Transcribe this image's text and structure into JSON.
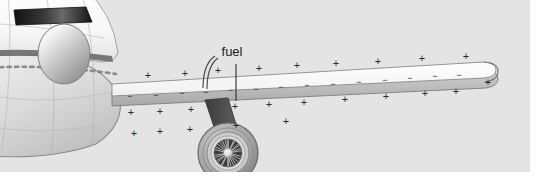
{
  "figure": {
    "name": "aircraft-wing-fuel-diagram",
    "width": 551,
    "height": 189,
    "background_color": "#ffffff",
    "panel_color": "#e4e4e4",
    "panel": {
      "x": 0,
      "y": 0,
      "width": 530,
      "height": 172
    }
  },
  "annotations": {
    "fuel_label": "fuel",
    "fuel_label_x": 232,
    "fuel_label_y": 60,
    "leader_line": {
      "x": 236,
      "y1": 64,
      "y2": 100
    },
    "flow_arrow": {
      "description": "curved-double-line-arrow"
    }
  },
  "colors": {
    "panel": "#e4e4e4",
    "fuselage_light": "#fdfdfd",
    "fuselage_shadow": "#c9c9c9",
    "fuselage_outline": "#8a8a8a",
    "windshield_dark": "#1c1c1c",
    "cheatline": "#6e6e6e",
    "nose_highlight": "#f2f2f2",
    "nose_mid": "#b9b9b9",
    "nose_dark": "#8e8e8e",
    "wing_top": "#fbfbfb",
    "wing_edge": "#b5b5b5",
    "wing_outline": "#7d7d7d",
    "pylon": "#4a4a4a",
    "nacelle_outer": "#9b9b9b",
    "nacelle_mid": "#c4c4c4",
    "fan_dark": "#3a3a3a",
    "spinner": "#e8e8e8",
    "symbol": "#2b2b2b",
    "text": "#1a1a1a"
  },
  "charges": {
    "plus_symbol": "+",
    "minus_symbol": "−",
    "plus_above_wing": [
      {
        "x": 148,
        "y": 76
      },
      {
        "x": 185,
        "y": 74
      },
      {
        "x": 218,
        "y": 71
      },
      {
        "x": 259,
        "y": 69
      },
      {
        "x": 297,
        "y": 66
      },
      {
        "x": 336,
        "y": 64
      },
      {
        "x": 378,
        "y": 62
      },
      {
        "x": 422,
        "y": 59
      },
      {
        "x": 466,
        "y": 57
      }
    ],
    "plus_below_wing": [
      {
        "x": 131,
        "y": 113
      },
      {
        "x": 160,
        "y": 112
      },
      {
        "x": 191,
        "y": 110
      },
      {
        "x": 235,
        "y": 107
      },
      {
        "x": 269,
        "y": 105
      },
      {
        "x": 304,
        "y": 103
      },
      {
        "x": 345,
        "y": 100
      },
      {
        "x": 386,
        "y": 97
      },
      {
        "x": 425,
        "y": 94
      },
      {
        "x": 456,
        "y": 92
      },
      {
        "x": 488,
        "y": 83
      }
    ],
    "plus_lower_row": [
      {
        "x": 134,
        "y": 134
      },
      {
        "x": 160,
        "y": 132
      },
      {
        "x": 190,
        "y": 130
      },
      {
        "x": 236,
        "y": 126
      },
      {
        "x": 286,
        "y": 122
      }
    ],
    "minus_on_wing": [
      {
        "x": 130,
        "y": 97
      },
      {
        "x": 156,
        "y": 96
      },
      {
        "x": 182,
        "y": 94
      },
      {
        "x": 206,
        "y": 93
      },
      {
        "x": 231,
        "y": 91
      },
      {
        "x": 256,
        "y": 90
      },
      {
        "x": 281,
        "y": 88
      },
      {
        "x": 307,
        "y": 86
      },
      {
        "x": 333,
        "y": 85
      },
      {
        "x": 359,
        "y": 83
      },
      {
        "x": 385,
        "y": 81
      },
      {
        "x": 410,
        "y": 79
      },
      {
        "x": 435,
        "y": 77
      },
      {
        "x": 459,
        "y": 76
      }
    ]
  },
  "parts": {
    "fuselage": "fuselage",
    "nose_radome": "nose-radome",
    "windshield": "cockpit-windshield",
    "cabin_windows": "cabin-window-row",
    "wing": "wing",
    "wingtip": "wingtip",
    "pylon": "engine-pylon",
    "nacelle": "engine-nacelle",
    "fan": "engine-fan",
    "spinner": "engine-spinner"
  }
}
